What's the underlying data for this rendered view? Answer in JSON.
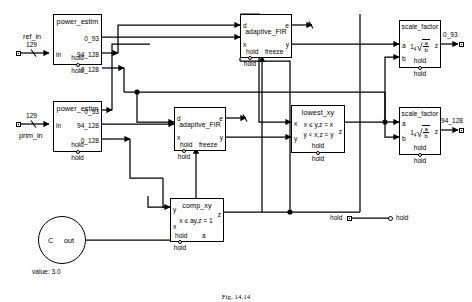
{
  "diagram": {
    "caption": "Fig. 14.14",
    "inputs": [
      {
        "name": "ref_in",
        "width": "129"
      },
      {
        "name": "prim_in",
        "width": "129"
      }
    ],
    "outputs": [
      {
        "name": "0_93"
      },
      {
        "name": "94_128"
      }
    ],
    "legend": {
      "left": "hold",
      "right": "hold"
    },
    "constant": {
      "symbol": "C",
      "out_port": "out",
      "value_label": "value: 3.0"
    },
    "hold_label": "hold",
    "blocks": [
      {
        "id": "power_estim_1",
        "title": "power_estim",
        "inputs": [
          "in"
        ],
        "outputs": [
          "0_93",
          "94_128",
          "0_128"
        ],
        "hold_port": "hold"
      },
      {
        "id": "power_estim_2",
        "title": "power_estim",
        "inputs": [
          "in"
        ],
        "outputs": [
          "0_93",
          "94_128",
          "0_128"
        ],
        "hold_port": "hold"
      },
      {
        "id": "adaptive_fir_1",
        "title": "adaptive_FIR",
        "inputs": [
          "d",
          "x"
        ],
        "outputs": [
          "e",
          "y"
        ],
        "hold_port": "hold",
        "freeze_port": "freeze"
      },
      {
        "id": "adaptive_fir_2",
        "title": "adaptive_FIR",
        "inputs": [
          "d",
          "x"
        ],
        "outputs": [
          "e",
          "y"
        ],
        "hold_port": "hold",
        "freeze_port": "freeze"
      },
      {
        "id": "lowest_xy",
        "title": "lowest_xy",
        "inputs": [
          "x",
          "y"
        ],
        "outputs": [
          "z"
        ],
        "hold_port": "hold",
        "formula_line1": "x ≤ y,z = x",
        "formula_line2": "y < x,z = y"
      },
      {
        "id": "comp_xy",
        "title": "comp_xy",
        "inputs": [
          "y",
          "x",
          "a"
        ],
        "outputs": [
          "z"
        ],
        "hold_port": "hold",
        "formula_line1": "x ≤ ay,z = 1"
      },
      {
        "id": "scale_factor_1",
        "title": "scale_factor",
        "inputs": [
          "a",
          "b"
        ],
        "outputs": [
          "z"
        ],
        "hold_port": "hold",
        "formula_lead": "1",
        "formula_root_index": "4",
        "formula_numerator": "a",
        "formula_denominator": "b"
      },
      {
        "id": "scale_factor_2",
        "title": "scale_factor",
        "inputs": [
          "a",
          "b"
        ],
        "outputs": [
          "z"
        ],
        "hold_port": "hold",
        "formula_lead": "1",
        "formula_root_index": "4",
        "formula_numerator": "a",
        "formula_denominator": "b"
      }
    ]
  }
}
